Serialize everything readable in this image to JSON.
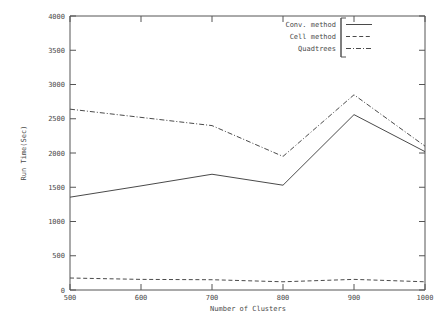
{
  "chart_data": {
    "type": "line",
    "title": "",
    "xlabel": "Number of Clusters",
    "ylabel": "Run Time(Sec)",
    "x": [
      500,
      600,
      700,
      800,
      900,
      1000
    ],
    "xlim": [
      500,
      1000
    ],
    "ylim": [
      0,
      4000
    ],
    "xticks": [
      "500",
      "600",
      "700",
      "800",
      "900",
      "1000"
    ],
    "yticks": [
      "0",
      "500",
      "1000",
      "1500",
      "2000",
      "2500",
      "3000",
      "3500",
      "4000"
    ],
    "grid": false,
    "legend_position": "top-right",
    "series": [
      {
        "name": "Conv. method",
        "style": "solid",
        "values": [
          1355,
          1520,
          1690,
          1530,
          2560,
          2020
        ]
      },
      {
        "name": "Cell method",
        "style": "dashed",
        "values": [
          175,
          155,
          150,
          120,
          155,
          120
        ]
      },
      {
        "name": "Quadtrees",
        "style": "dash-dot",
        "values": [
          2640,
          2520,
          2400,
          1950,
          2850,
          2100
        ]
      }
    ]
  },
  "axes": {
    "y_title": "Run Time(Sec)",
    "x_title": "Number of Clusters",
    "y_tick_0": "0",
    "y_tick_1": "500",
    "y_tick_2": "1000",
    "y_tick_3": "1500",
    "y_tick_4": "2000",
    "y_tick_5": "2500",
    "y_tick_6": "3000",
    "y_tick_7": "3500",
    "y_tick_8": "4000",
    "x_tick_0": "500",
    "x_tick_1": "600",
    "x_tick_2": "700",
    "x_tick_3": "800",
    "x_tick_4": "900",
    "x_tick_5": "1000"
  },
  "legend": {
    "entry_0": "Conv. method",
    "entry_1": "Cell method",
    "entry_2": "Quadtrees"
  },
  "colors": {
    "background": "#ffffff",
    "ink": "#4a4a4a",
    "axis": "#555555"
  }
}
